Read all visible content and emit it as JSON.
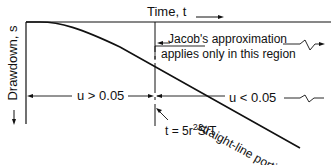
{
  "diagram": {
    "x_axis_label": "Time, t",
    "y_axis_label": "Drawdown, s",
    "region_note_line1": "Jacob's approximation",
    "region_note_line2": "applies only in this region",
    "left_region_label": "u > 0.05",
    "right_region_label": "u < 0.05",
    "threshold_label": "t = 5r",
    "threshold_exp": "2",
    "threshold_suffix": "S/T",
    "curve_label": "straight-line portion",
    "colors": {
      "line": "#111111",
      "background": "#ffffff"
    }
  }
}
